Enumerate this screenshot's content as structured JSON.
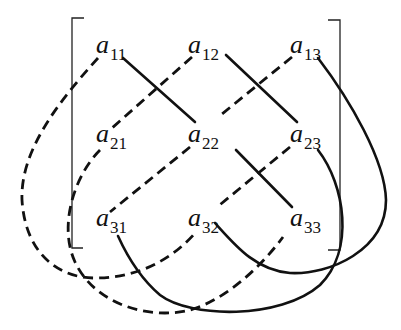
{
  "colors": {
    "ink": "#111111",
    "background": "#ffffff"
  },
  "entries": [
    {
      "id": "a11",
      "base": "a",
      "sub": "11",
      "x": 96,
      "y": 32
    },
    {
      "id": "a12",
      "base": "a",
      "sub": "12",
      "x": 188,
      "y": 32
    },
    {
      "id": "a13",
      "base": "a",
      "sub": "13",
      "x": 290,
      "y": 32
    },
    {
      "id": "a21",
      "base": "a",
      "sub": "21",
      "x": 96,
      "y": 121
    },
    {
      "id": "a22",
      "base": "a",
      "sub": "22",
      "x": 188,
      "y": 121
    },
    {
      "id": "a23",
      "base": "a",
      "sub": "23",
      "x": 290,
      "y": 121
    },
    {
      "id": "a31",
      "base": "a",
      "sub": "31",
      "x": 96,
      "y": 205
    },
    {
      "id": "a32",
      "base": "a",
      "sub": "32",
      "x": 188,
      "y": 205
    },
    {
      "id": "a33",
      "base": "a",
      "sub": "33",
      "x": 290,
      "y": 205
    }
  ],
  "legend": {
    "solid": "positive products (a11a22a33, a12a23a31, a13a21a32)",
    "dashed": "negative products (a13a22a31, a12a21a33, a11a23a32)"
  }
}
